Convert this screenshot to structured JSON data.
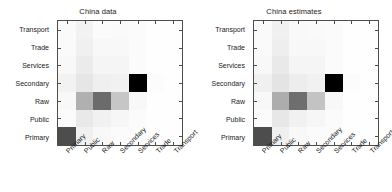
{
  "figure": {
    "background": "#ffffff",
    "axis_color": "#4d4d4d",
    "text_color": "#1a1a1a"
  },
  "chart_data": [
    {
      "type": "heatmap",
      "title": "China data",
      "xlabel": "",
      "ylabel": "",
      "grid": false,
      "legend": "none",
      "colormap": "gray_reversed",
      "vmin": 0,
      "vmax": 1,
      "x_categories": [
        "Primary",
        "Public",
        "Raw",
        "Secondary",
        "Services",
        "Trade",
        "Transport"
      ],
      "y_categories": [
        "Transport",
        "Trade",
        "Services",
        "Secondary",
        "Raw",
        "Public",
        "Primary"
      ],
      "rows": [
        {
          "label": "Transport",
          "values": [
            0.01,
            0.04,
            0.01,
            0.01,
            0.01,
            0.0,
            0.0
          ],
          "colors": [
            "#fafafa",
            "#f2f2f2",
            "#fbfbfb",
            "#fafafa",
            "#fbfbfb",
            "#fefefe",
            "#fefefe"
          ]
        },
        {
          "label": "Trade",
          "values": [
            0.01,
            0.05,
            0.02,
            0.02,
            0.01,
            0.0,
            0.0
          ],
          "colors": [
            "#fafafa",
            "#f0f0f0",
            "#f8f8f8",
            "#f8f8f8",
            "#fbfbfb",
            "#fefefe",
            "#fefefe"
          ]
        },
        {
          "label": "Services",
          "values": [
            0.02,
            0.07,
            0.03,
            0.03,
            0.01,
            0.0,
            0.0
          ],
          "colors": [
            "#f8f8f8",
            "#ebebeb",
            "#f5f5f5",
            "#f5f5f5",
            "#fbfbfb",
            "#fefefe",
            "#fefefe"
          ]
        },
        {
          "label": "Secondary",
          "values": [
            0.04,
            0.09,
            0.06,
            0.05,
            1.0,
            0.01,
            0.0
          ],
          "colors": [
            "#f2f2f2",
            "#e6e6e6",
            "#efefef",
            "#f1f1f1",
            "#000000",
            "#fcfcfc",
            "#fefefe"
          ]
        },
        {
          "label": "Raw",
          "values": [
            0.02,
            0.31,
            0.58,
            0.22,
            0.02,
            0.0,
            0.0
          ],
          "colors": [
            "#f8f8f8",
            "#b0b0b0",
            "#6b6b6b",
            "#c6c6c6",
            "#f8f8f8",
            "#fefefe",
            "#fefefe"
          ]
        },
        {
          "label": "Public",
          "values": [
            0.01,
            0.08,
            0.05,
            0.03,
            0.01,
            0.0,
            0.0
          ],
          "colors": [
            "#fbfbfb",
            "#e9e9e9",
            "#f1f1f1",
            "#f6f6f6",
            "#fbfbfb",
            "#fefefe",
            "#fefefe"
          ]
        },
        {
          "label": "Primary",
          "values": [
            0.7,
            0.05,
            0.02,
            0.01,
            0.01,
            0.0,
            0.0
          ],
          "colors": [
            "#4d4d4d",
            "#f0f0f0",
            "#f8f8f8",
            "#fbfbfb",
            "#fbfbfb",
            "#fefefe",
            "#fefefe"
          ]
        }
      ]
    },
    {
      "type": "heatmap",
      "title": "China estimates",
      "xlabel": "",
      "ylabel": "",
      "grid": false,
      "legend": "none",
      "colormap": "gray_reversed",
      "vmin": 0,
      "vmax": 1,
      "x_categories": [
        "Primary",
        "Public",
        "Raw",
        "Secondary",
        "Services",
        "Trade",
        "Transport"
      ],
      "y_categories": [
        "Transport",
        "Trade",
        "Services",
        "Secondary",
        "Raw",
        "Public",
        "Primary"
      ],
      "rows": [
        {
          "label": "Transport",
          "values": [
            0.01,
            0.05,
            0.02,
            0.01,
            0.01,
            0.0,
            0.0
          ],
          "colors": [
            "#fafafa",
            "#f0f0f0",
            "#f9f9f9",
            "#fafafa",
            "#fbfbfb",
            "#fefefe",
            "#fefefe"
          ]
        },
        {
          "label": "Trade",
          "values": [
            0.01,
            0.06,
            0.02,
            0.02,
            0.01,
            0.0,
            0.0
          ],
          "colors": [
            "#fafafa",
            "#eeeeee",
            "#f8f8f8",
            "#f8f8f8",
            "#fbfbfb",
            "#fefefe",
            "#fefefe"
          ]
        },
        {
          "label": "Services",
          "values": [
            0.02,
            0.08,
            0.03,
            0.03,
            0.01,
            0.0,
            0.0
          ],
          "colors": [
            "#f8f8f8",
            "#e9e9e9",
            "#f5f5f5",
            "#f5f5f5",
            "#fbfbfb",
            "#fefefe",
            "#fefefe"
          ]
        },
        {
          "label": "Secondary",
          "values": [
            0.05,
            0.1,
            0.07,
            0.05,
            1.0,
            0.01,
            0.0
          ],
          "colors": [
            "#f0f0f0",
            "#e4e4e4",
            "#ededed",
            "#f1f1f1",
            "#000000",
            "#fcfcfc",
            "#fefefe"
          ]
        },
        {
          "label": "Raw",
          "values": [
            0.02,
            0.33,
            0.56,
            0.24,
            0.02,
            0.0,
            0.0
          ],
          "colors": [
            "#f8f8f8",
            "#adadad",
            "#6e6e6e",
            "#c3c3c3",
            "#f8f8f8",
            "#fefefe",
            "#fefefe"
          ]
        },
        {
          "label": "Public",
          "values": [
            0.01,
            0.09,
            0.05,
            0.03,
            0.01,
            0.0,
            0.0
          ],
          "colors": [
            "#fbfbfb",
            "#e7e7e7",
            "#f1f1f1",
            "#f6f6f6",
            "#fbfbfb",
            "#fefefe",
            "#fefefe"
          ]
        },
        {
          "label": "Primary",
          "values": [
            0.7,
            0.06,
            0.02,
            0.01,
            0.01,
            0.0,
            0.0
          ],
          "colors": [
            "#4d4d4d",
            "#efefef",
            "#f8f8f8",
            "#fbfbfb",
            "#fbfbfb",
            "#fefefe",
            "#fefefe"
          ]
        }
      ]
    }
  ]
}
